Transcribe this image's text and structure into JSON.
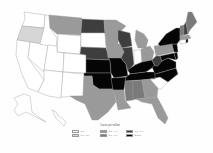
{
  "map": {
    "type": "choropleth",
    "region": "United States",
    "legend": {
      "title": "Cases per million",
      "classes": [
        {
          "label": "0.0",
          "color": "#ffffff"
        },
        {
          "label": "0.1 - 2.4",
          "color": "#d6d6d6"
        },
        {
          "label": "2.5 - 4.9",
          "color": "#9a9a9a"
        },
        {
          "label": "5.0 - 7.4",
          "color": "#7a7a7a"
        },
        {
          "label": "7.5 - 9.9",
          "color": "#3e3e3e"
        },
        {
          "label": "≥ 10.0",
          "color": "#050505"
        }
      ]
    },
    "states": {
      "WA": "0.0",
      "OR": "0.1 - 2.4",
      "CA": "0.0",
      "NV": "0.0",
      "ID": "0.0",
      "MT": "2.5 - 4.9",
      "WY": "0.0",
      "UT": "0.0",
      "AZ": "0.0",
      "CO": "0.0",
      "NM": "0.0",
      "ND": "7.5 - 9.9",
      "SD": "0.0",
      "NE": "7.5 - 9.9",
      "KS": "≥ 10.0",
      "OK": "≥ 10.0",
      "TX": "2.5 - 4.9",
      "MN": "2.5 - 4.9",
      "IA": "2.5 - 4.9",
      "MO": "≥ 10.0",
      "AR": "≥ 10.0",
      "LA": "2.5 - 4.9",
      "WI": "7.5 - 9.9",
      "IL": "7.5 - 9.9",
      "MI": "2.5 - 4.9",
      "IN": "0.0",
      "OH": "2.5 - 4.9",
      "KY": "≥ 10.0",
      "TN": "≥ 10.0",
      "MS": "5.0 - 7.4",
      "AL": "5.0 - 7.4",
      "GA": "2.5 - 4.9",
      "FL": "2.5 - 4.9",
      "SC": "0.0",
      "NC": "≥ 10.0",
      "VA": "≥ 10.0",
      "WV": "7.5 - 9.9",
      "PA": "2.5 - 4.9",
      "NY": "≥ 10.0",
      "VT": "5.0 - 7.4",
      "NH": "7.5 - 9.9",
      "ME": "5.0 - 7.4",
      "MA": "2.5 - 4.9",
      "CT": "0.0",
      "RI": "≥ 10.0",
      "NJ": "≥ 10.0",
      "DE": "≥ 10.0",
      "MD": "≥ 10.0",
      "AK": "0.0",
      "HI": "0.0"
    }
  }
}
